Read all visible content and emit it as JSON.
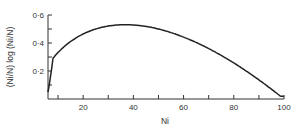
{
  "chart_data": {
    "type": "line",
    "title": "",
    "xlabel": "Ni",
    "ylabel": "(Ni/N) log (Ni/N)",
    "xlim": [
      6,
      100
    ],
    "ylim": [
      0,
      0.6
    ],
    "x_ticks_minor": [
      10,
      20,
      30,
      40,
      50,
      60,
      70,
      80,
      90,
      100
    ],
    "x_tick_labels": [
      "20",
      "40",
      "60",
      "80",
      "100"
    ],
    "y_tick_labels": [
      "0·2",
      "0·4",
      "0·6"
    ],
    "grid": false,
    "legend": null,
    "series": [
      {
        "name": "(Ni/N) log (Ni/N)",
        "x": [
          6,
          8,
          10,
          15,
          20,
          25,
          30,
          35,
          40,
          45,
          50,
          55,
          60,
          65,
          70,
          75,
          80,
          85,
          90,
          95,
          100
        ],
        "y": [
          0.06,
          0.27,
          0.33,
          0.41,
          0.46,
          0.5,
          0.52,
          0.53,
          0.53,
          0.52,
          0.5,
          0.47,
          0.44,
          0.4,
          0.36,
          0.31,
          0.26,
          0.2,
          0.14,
          0.07,
          0.02
        ]
      }
    ]
  }
}
